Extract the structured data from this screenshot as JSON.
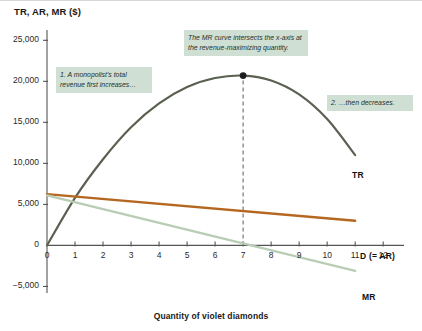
{
  "figure": {
    "y_axis_title": "TR, AR, MR ($)",
    "x_axis_title": "Quantity of violet diamonds"
  },
  "annotations": [
    {
      "id": "tr-increases",
      "text": "1. A monopolist's total revenue first increases…"
    },
    {
      "id": "mr-intersects",
      "text": "The MR curve intersects the x-axis at the revenue-maximizing quantity."
    },
    {
      "id": "tr-decreases",
      "text": "2. …then decreases."
    }
  ],
  "curve_labels": {
    "tr": "TR",
    "demand": "D (= AR)",
    "mr": "MR"
  },
  "colors": {
    "tr": "#5a6151",
    "demand": "#b5671f",
    "mr": "#b9cdb5",
    "callout_bg": "#cfdfd4",
    "axis": "#555555",
    "dashed_guide": "#6b6b6b"
  },
  "chart_data": {
    "type": "line",
    "title": "",
    "xlabel": "Quantity of violet diamonds",
    "ylabel": "TR, AR, MR ($)",
    "xlim": [
      0,
      12.6
    ],
    "ylim": [
      -5800,
      26500
    ],
    "grid": false,
    "legend": "inline-curve-labels",
    "x_ticks": [
      0,
      1,
      2,
      3,
      4,
      5,
      6,
      7,
      8,
      9,
      10,
      11,
      12
    ],
    "x_tick_labels": [
      "0",
      "1",
      "2",
      "3",
      "4",
      "5",
      "6",
      "7",
      "8",
      "9",
      "10",
      "11",
      "12"
    ],
    "y_ticks": [
      -5000,
      0,
      5000,
      10000,
      15000,
      20000,
      25000
    ],
    "y_tick_labels": [
      "−5,000",
      "0",
      "5,000",
      "10,000",
      "15,000",
      "20,000",
      "25,000"
    ],
    "markers": [
      {
        "name": "revenue-maximizing-point",
        "x": 7,
        "y": 20700,
        "label": ""
      }
    ],
    "guides": [
      {
        "name": "revenue-max-quantity-guide",
        "type": "vertical-dashed",
        "x": 7,
        "y_from": 0,
        "y_to": 20700
      }
    ],
    "series": [
      {
        "name": "TR",
        "type": "curve",
        "color": "#5a6151",
        "x": [
          0,
          1,
          2,
          3,
          4,
          5,
          6,
          7,
          8,
          9,
          10,
          11
        ],
        "values": [
          0,
          5800,
          10500,
          14400,
          17300,
          19300,
          20400,
          20700,
          20100,
          18400,
          15400,
          11000
        ]
      },
      {
        "name": "D (= AR)",
        "type": "line",
        "color": "#b5671f",
        "x": [
          0,
          11
        ],
        "values": [
          6250,
          3000
        ]
      },
      {
        "name": "MR",
        "type": "line",
        "color": "#b9cdb5",
        "x": [
          0,
          11
        ],
        "values": [
          6100,
          -3100
        ]
      }
    ]
  }
}
